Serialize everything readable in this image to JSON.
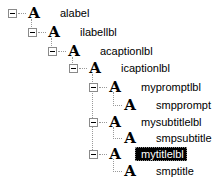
{
  "tree": {
    "nodes": [
      {
        "label": "alabel",
        "level": 0,
        "expanded": true,
        "icon": "font-a-icon"
      },
      {
        "label": "ilabellbl",
        "level": 1,
        "expanded": true,
        "icon": "font-a-icon"
      },
      {
        "label": "acaptionlbl",
        "level": 2,
        "expanded": true,
        "icon": "font-a-icon"
      },
      {
        "label": "icaptionlbl",
        "level": 3,
        "expanded": true,
        "icon": "font-a-icon"
      },
      {
        "label": "mypromptlbl",
        "level": 4,
        "expanded": true,
        "icon": "font-a-icon"
      },
      {
        "label": "smpprompt",
        "level": 5,
        "expanded": false,
        "icon": "font-a-icon"
      },
      {
        "label": "mysubtitlelbl",
        "level": 4,
        "expanded": true,
        "icon": "font-a-icon"
      },
      {
        "label": "smpsubtitle",
        "level": 5,
        "expanded": false,
        "icon": "font-a-icon"
      },
      {
        "label": "mytitlelbl",
        "level": 4,
        "expanded": true,
        "icon": "font-a-icon",
        "selected": true
      },
      {
        "label": "smptitle",
        "level": 5,
        "expanded": false,
        "icon": "font-a-icon"
      }
    ],
    "icon_glyph": "A",
    "selection_color": "#000000"
  }
}
